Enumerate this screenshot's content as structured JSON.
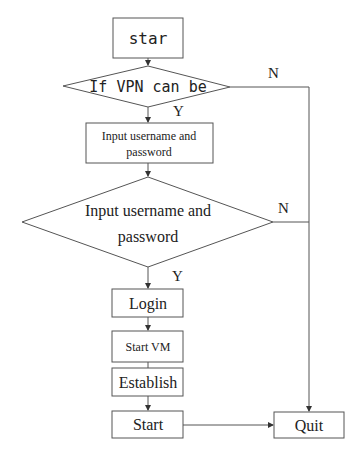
{
  "diagram": {
    "type": "flowchart",
    "nodes": {
      "start": {
        "label": "star",
        "shape": "rectangle"
      },
      "vpn_check": {
        "label": "If VPN can be",
        "shape": "diamond"
      },
      "input_creds": {
        "line1": "Input username and",
        "line2": "password",
        "shape": "rectangle"
      },
      "creds_check": {
        "line1": "Input username and",
        "line2": "password",
        "shape": "diamond"
      },
      "login": {
        "label": "Login",
        "shape": "rectangle"
      },
      "start_vm": {
        "label": "Start VM",
        "shape": "rectangle"
      },
      "establish": {
        "label": "Establish",
        "shape": "rectangle"
      },
      "start_final": {
        "label": "Start",
        "shape": "rectangle"
      },
      "quit": {
        "label": "Quit",
        "shape": "rectangle"
      }
    },
    "edge_labels": {
      "vpn_yes": "Y",
      "vpn_no": "N",
      "creds_yes": "Y",
      "creds_no": "N"
    },
    "edges": [
      {
        "from": "start",
        "to": "vpn_check"
      },
      {
        "from": "vpn_check",
        "to": "input_creds",
        "label": "Y"
      },
      {
        "from": "vpn_check",
        "to": "quit",
        "label": "N"
      },
      {
        "from": "input_creds",
        "to": "creds_check"
      },
      {
        "from": "creds_check",
        "to": "login",
        "label": "Y"
      },
      {
        "from": "creds_check",
        "to": "quit",
        "label": "N"
      },
      {
        "from": "login",
        "to": "start_vm"
      },
      {
        "from": "start_vm",
        "to": "establish"
      },
      {
        "from": "establish",
        "to": "start_final"
      },
      {
        "from": "start_final",
        "to": "quit"
      }
    ]
  }
}
